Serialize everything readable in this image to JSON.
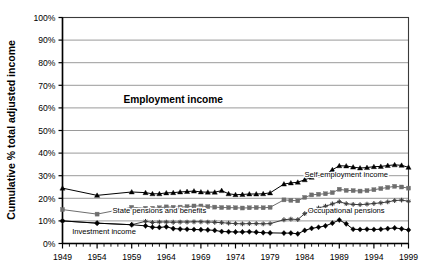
{
  "chart_data": {
    "type": "line",
    "title": "",
    "xlabel": "",
    "ylabel": "Cumulative % total adjusted income",
    "ylim": [
      0,
      100
    ],
    "xlim": [
      1949,
      1999
    ],
    "grid": true,
    "legend_position": "inline-annotations",
    "y_ticks": [
      "0%",
      "10%",
      "20%",
      "30%",
      "40%",
      "50%",
      "60%",
      "70%",
      "80%",
      "90%",
      "100%"
    ],
    "y_tick_values": [
      0,
      10,
      20,
      30,
      40,
      50,
      60,
      70,
      80,
      90,
      100
    ],
    "x_ticks": [
      "1949",
      "1954",
      "1959",
      "1964",
      "1969",
      "1974",
      "1979",
      "1984",
      "1989",
      "1994",
      "1999"
    ],
    "x_tick_values": [
      1949,
      1954,
      1959,
      1964,
      1969,
      1974,
      1979,
      1984,
      1989,
      1994,
      1999
    ],
    "x": [
      1949,
      1954,
      1959,
      1961,
      1962,
      1963,
      1964,
      1965,
      1966,
      1967,
      1968,
      1969,
      1970,
      1971,
      1972,
      1973,
      1974,
      1975,
      1976,
      1977,
      1978,
      1979,
      1981,
      1982,
      1983,
      1984,
      1985,
      1986,
      1987,
      1988,
      1989,
      1990,
      1991,
      1992,
      1993,
      1994,
      1995,
      1996,
      1997,
      1998,
      1999
    ],
    "series": [
      {
        "name": "Self-employment income",
        "marker": "triangle",
        "color": "#000000",
        "label_x": 1990,
        "label_y": 29.5,
        "values": [
          24.5,
          21.3,
          22.8,
          22.5,
          22.0,
          22.0,
          22.4,
          22.5,
          22.8,
          23.0,
          23.2,
          22.8,
          22.7,
          22.7,
          23.4,
          22.0,
          21.6,
          21.7,
          21.9,
          21.9,
          22.0,
          22.4,
          26.3,
          26.8,
          27.1,
          28.2,
          29.3,
          30.3,
          30.5,
          32.6,
          34.4,
          34.3,
          33.8,
          33.4,
          33.6,
          34.0,
          34.1,
          34.5,
          34.8,
          34.6,
          33.7
        ]
      },
      {
        "name": "State pensions and benefits",
        "marker": "square",
        "color": "#6e6e6e",
        "label_x": 1963,
        "label_y": 13.4,
        "values": [
          15.0,
          13.0,
          16.0,
          15.6,
          15.6,
          15.8,
          16.2,
          16.0,
          16.1,
          16.3,
          16.6,
          16.6,
          16.3,
          16.1,
          15.9,
          15.9,
          15.8,
          15.7,
          15.8,
          15.9,
          15.8,
          16.0,
          19.3,
          19.1,
          18.9,
          20.4,
          21.5,
          21.8,
          22.0,
          22.5,
          24.0,
          23.5,
          23.4,
          23.2,
          23.4,
          23.8,
          24.3,
          24.8,
          25.3,
          25.0,
          24.5
        ]
      },
      {
        "name": "Occupational pensions",
        "marker": "cross",
        "color": "#3d3d3d",
        "label_x": 1990,
        "label_y": 13.3,
        "values": [
          10.0,
          9.0,
          8.3,
          9.8,
          9.3,
          9.5,
          9.5,
          9.4,
          9.5,
          9.5,
          9.6,
          9.6,
          9.5,
          9.4,
          9.2,
          9.0,
          8.8,
          8.7,
          8.8,
          8.8,
          8.7,
          8.8,
          10.5,
          10.8,
          10.6,
          13.2,
          14.8,
          15.7,
          16.5,
          17.5,
          18.5,
          17.6,
          17.3,
          17.2,
          17.4,
          17.7,
          18.0,
          18.4,
          19.0,
          19.2,
          18.7
        ]
      },
      {
        "name": "Investment income",
        "marker": "diamond",
        "color": "#000000",
        "label_x": 1955,
        "label_y": 4.4,
        "values": [
          10.0,
          9.0,
          8.3,
          7.8,
          7.2,
          7.1,
          7.4,
          6.6,
          6.4,
          6.3,
          6.2,
          6.1,
          6.0,
          5.8,
          5.3,
          5.2,
          5.1,
          5.1,
          5.2,
          5.0,
          4.8,
          4.7,
          4.6,
          4.6,
          4.3,
          5.8,
          6.7,
          7.2,
          7.8,
          9.0,
          10.4,
          8.7,
          6.3,
          6.2,
          6.3,
          6.2,
          6.3,
          6.6,
          6.9,
          6.5,
          6.0
        ]
      }
    ],
    "annotations": [
      {
        "text": "Employment income",
        "x": 1965,
        "y": 62,
        "bold": true
      }
    ]
  }
}
